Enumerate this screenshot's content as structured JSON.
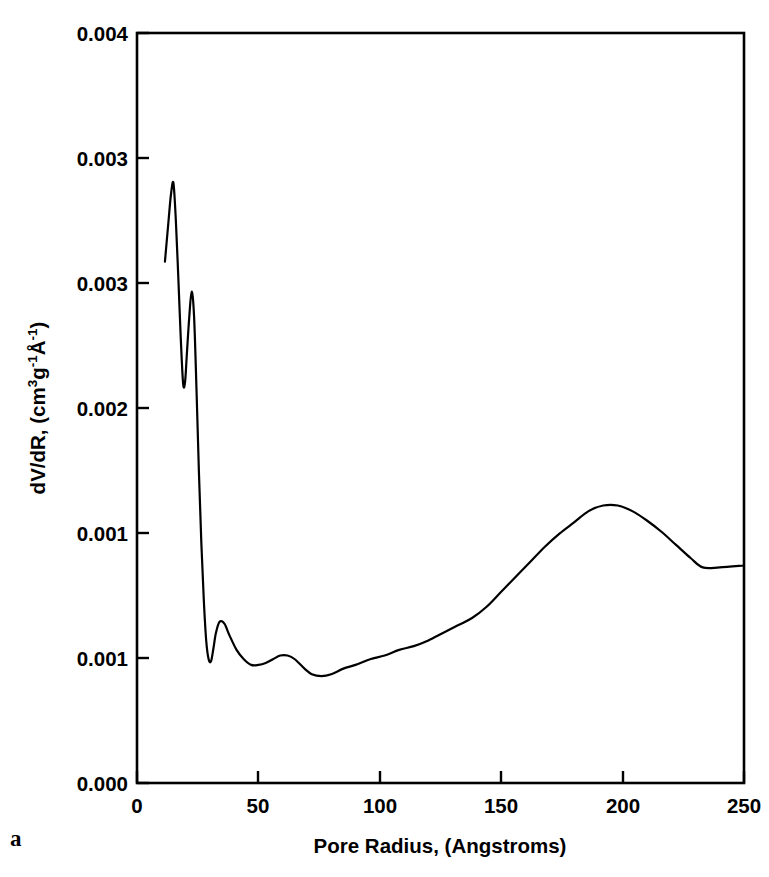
{
  "figure": {
    "panel_label": "a",
    "background_color": "#ffffff",
    "line_color": "#000000"
  },
  "chart_data": {
    "type": "line",
    "title": "",
    "subtitle": "",
    "xlabel": "Pore Radius, (Angstroms)",
    "ylabel": "dV/dR, (cm3g-1A-1)",
    "ylabel_parts": {
      "lead": "dV/dR, (cm",
      "sup1": "3",
      "mid1": "g",
      "sup2": "-1",
      "mid2": "Å",
      "sup3": "-1",
      "tail": ")"
    },
    "xlim": [
      0,
      250
    ],
    "ylim": [
      0,
      0.004
    ],
    "grid": false,
    "legend": null,
    "xticks": [
      0,
      50,
      100,
      150,
      200,
      250
    ],
    "xtick_labels": [
      "0",
      "50",
      "100",
      "150",
      "200",
      "250"
    ],
    "yticks": [
      0.0,
      0.0005,
      0.001,
      0.0015,
      0.002,
      0.0025,
      0.003,
      0.0035,
      0.004
    ],
    "ytick_positions": [
      0.0,
      0.0005,
      0.001,
      0.0015,
      0.002,
      0.0025,
      0.003,
      0.0035,
      0.004
    ],
    "ytick_labels_shown": [
      "0.000",
      "0.001",
      "0.001",
      "0.002",
      "0.003",
      "0.003",
      "0.004"
    ],
    "ytick_label_values": [
      0.0,
      0.0005,
      0.001,
      0.0015,
      0.002,
      0.0025,
      0.003,
      0.0035,
      0.004
    ],
    "ytick_display": [
      {
        "value": 0.004,
        "label": "0.004"
      },
      {
        "value": 0.0035,
        "label": "0.003"
      },
      {
        "value": 0.003,
        "label": "0.003"
      },
      {
        "value": 0.0025,
        "label": "0.002"
      },
      {
        "value": 0.002,
        "label": "0.001"
      },
      {
        "value": 0.0015,
        "label": "0.001"
      },
      {
        "value": 0.001,
        "label": "0.000"
      }
    ],
    "series": [
      {
        "name": "dV/dR",
        "x": [
          11.5,
          13.0,
          14.0,
          15.0,
          16.0,
          17.0,
          18.0,
          19.0,
          19.8,
          20.5,
          21.5,
          22.5,
          23.5,
          24.5,
          25.5,
          26.5,
          27.5,
          28.5,
          29.5,
          30.5,
          31.5,
          32.5,
          34.0,
          36.0,
          38.0,
          41.0,
          44.0,
          47.0,
          50.0,
          53.0,
          56.0,
          59.0,
          62.0,
          65.0,
          69.0,
          72.0,
          76.0,
          80.0,
          85.0,
          90.0,
          96.0,
          102.0,
          108.0,
          114.0,
          120.0,
          126.0,
          132.0,
          138.0,
          144.0,
          150.0,
          156.0,
          162.0,
          168.0,
          174.0,
          180.0,
          186.0,
          192.0,
          198.0,
          204.0,
          210.0,
          216.0,
          222.0,
          228.0,
          233.0,
          240.0,
          250.0
        ],
        "y": [
          0.00278,
          0.003,
          0.00314,
          0.0032,
          0.003,
          0.0027,
          0.00238,
          0.00213,
          0.00214,
          0.00228,
          0.00248,
          0.00262,
          0.00249,
          0.0021,
          0.00166,
          0.00128,
          0.00098,
          0.00076,
          0.00066,
          0.00065,
          0.00072,
          0.0008,
          0.00086,
          0.00085,
          0.00079,
          0.00071,
          0.00066,
          0.00063,
          0.00063,
          0.00064,
          0.00066,
          0.00068,
          0.00068,
          0.00066,
          0.00061,
          0.00058,
          0.00057,
          0.00058,
          0.00061,
          0.00063,
          0.00066,
          0.00068,
          0.00071,
          0.00073,
          0.00076,
          0.0008,
          0.00084,
          0.00088,
          0.00094,
          0.00102,
          0.0011,
          0.00118,
          0.00126,
          0.00133,
          0.00139,
          0.00145,
          0.00148,
          0.00148,
          0.00145,
          0.0014,
          0.00134,
          0.00127,
          0.0012,
          0.00115,
          0.00115,
          0.00116
        ],
        "peaks": [
          {
            "x": 15.0,
            "y": 0.0032,
            "note": "primary sharp peak"
          },
          {
            "x": 22.5,
            "y": 0.00262,
            "note": "secondary sharp peak"
          },
          {
            "x": 34.0,
            "y": 0.00086,
            "note": "small shoulder bump"
          },
          {
            "x": 59.0,
            "y": 0.00068,
            "note": "minor bump"
          },
          {
            "x": 192.0,
            "y": 0.00148,
            "note": "broad mesopore maximum"
          }
        ],
        "minima": [
          {
            "x": 19.8,
            "y": 0.00214,
            "note": "valley between sharp peaks"
          },
          {
            "x": 30.0,
            "y": 0.00065,
            "note": "post-peak minimum"
          },
          {
            "x": 76.0,
            "y": 0.00057,
            "note": "broad minimum"
          }
        ]
      }
    ]
  }
}
